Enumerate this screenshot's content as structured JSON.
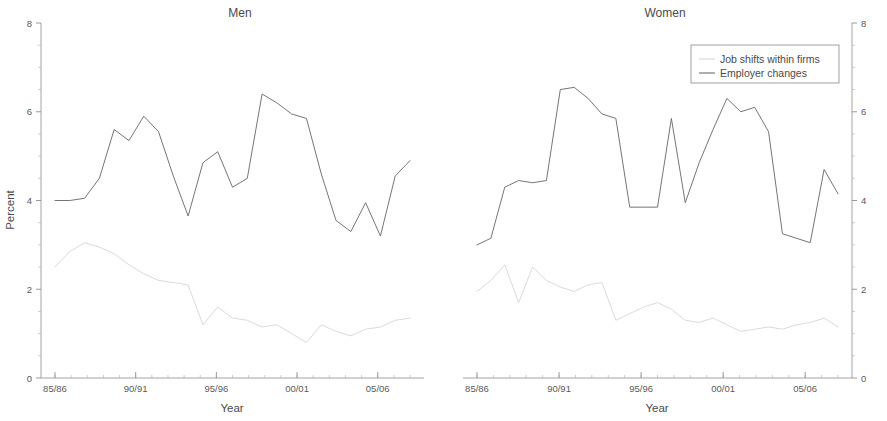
{
  "figure": {
    "xlabel": "Year",
    "ylabel": "Percent"
  },
  "panels": [
    {
      "key": "men",
      "title": "Men"
    },
    {
      "key": "women",
      "title": "Women"
    }
  ],
  "legend": {
    "position": "top-right-of-women-panel",
    "entries": [
      {
        "label": "Job shifts within firms",
        "color": "#d8d8d8"
      },
      {
        "label": "Employer changes",
        "color": "#6e6e6e"
      }
    ]
  },
  "axes": {
    "y_ticks": [
      "0",
      "2",
      "4",
      "6",
      "8"
    ],
    "y_values": [
      0,
      2,
      4,
      6,
      8
    ],
    "y_minor_step": 0.5,
    "ylim": [
      0,
      8
    ],
    "x_ticks": [
      "85/86",
      "90/91",
      "95/96",
      "00/01",
      "05/06"
    ],
    "x_tick_indices": [
      0,
      5,
      10,
      15,
      20
    ],
    "grid": false
  },
  "chart_data": {
    "type": "line",
    "title": "",
    "xlabel": "Year",
    "ylabel": "Percent",
    "ylim": [
      0,
      8
    ],
    "grid": false,
    "legend_position": "top right",
    "x": [
      "85/86",
      "86/87",
      "87/88",
      "88/89",
      "89/90",
      "90/91",
      "91/92",
      "92/93",
      "93/94",
      "94/95",
      "95/96",
      "96/97",
      "97/98",
      "98/99",
      "99/00",
      "00/01",
      "01/02",
      "02/03",
      "03/04",
      "04/05",
      "05/06",
      "06/07",
      "07/08"
    ],
    "panels": [
      {
        "name": "Men",
        "series": [
          {
            "name": "Employer changes",
            "color": "#6e6e6e",
            "values": [
              4.0,
              4.0,
              4.05,
              4.5,
              5.6,
              5.35,
              5.9,
              5.55,
              4.55,
              3.65,
              4.85,
              5.1,
              4.3,
              4.5,
              6.4,
              6.2,
              5.95,
              5.85,
              4.6,
              3.55,
              3.3,
              3.95,
              3.2,
              4.55,
              4.9
            ]
          },
          {
            "name": "Job shifts within firms",
            "color": "#d8d8d8",
            "values": [
              2.5,
              2.85,
              3.05,
              2.95,
              2.8,
              2.55,
              2.35,
              2.2,
              2.15,
              2.1,
              1.2,
              1.6,
              1.35,
              1.3,
              1.15,
              1.2,
              1.0,
              0.8,
              1.2,
              1.05,
              0.95,
              1.1,
              1.15,
              1.3,
              1.35
            ]
          }
        ]
      },
      {
        "name": "Women",
        "series": [
          {
            "name": "Employer changes",
            "color": "#6e6e6e",
            "values": [
              3.0,
              3.15,
              4.3,
              4.45,
              4.4,
              4.45,
              6.5,
              6.55,
              6.3,
              5.95,
              5.85,
              3.85,
              3.85,
              3.85,
              5.85,
              3.95,
              4.85,
              5.6,
              6.3,
              6.0,
              6.1,
              5.55,
              3.25,
              3.15,
              3.05,
              4.7,
              4.15
            ]
          },
          {
            "name": "Job shifts within firms",
            "color": "#d8d8d8",
            "values": [
              1.95,
              2.2,
              2.55,
              1.7,
              2.5,
              2.2,
              2.05,
              1.95,
              2.1,
              2.15,
              1.3,
              1.45,
              1.6,
              1.7,
              1.55,
              1.3,
              1.25,
              1.35,
              1.2,
              1.05,
              1.1,
              1.15,
              1.1,
              1.2,
              1.25,
              1.35,
              1.15
            ]
          }
        ]
      }
    ]
  }
}
